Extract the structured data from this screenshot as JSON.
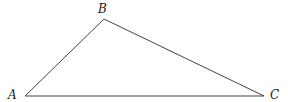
{
  "diagram": {
    "type": "triangle",
    "stroke_color": "#444444",
    "vertices": [
      {
        "name": "A",
        "label": "A",
        "x": 25,
        "y": 96
      },
      {
        "name": "B",
        "label": "B",
        "x": 104,
        "y": 19
      },
      {
        "name": "C",
        "label": "C",
        "x": 264,
        "y": 96
      }
    ],
    "edges": [
      {
        "from": "A",
        "to": "B"
      },
      {
        "from": "B",
        "to": "C"
      },
      {
        "from": "C",
        "to": "A"
      }
    ]
  }
}
